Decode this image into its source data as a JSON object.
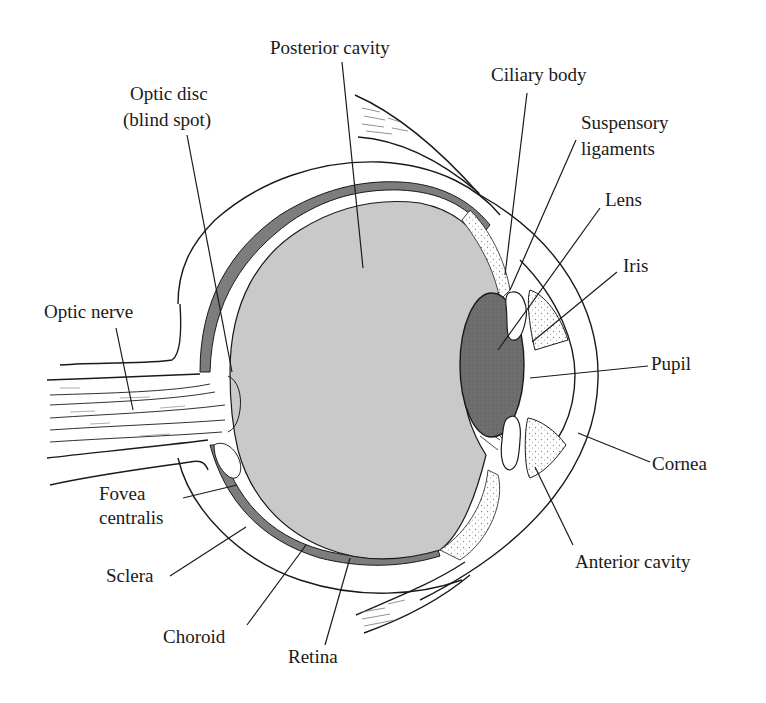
{
  "diagram": {
    "colors": {
      "background": "#ffffff",
      "ink": "#1a1a1a",
      "vitreous_fill": "#c9c9c9",
      "choroid_fill": "#7d7d7d",
      "lens_fill": "#6e6e6e",
      "stipple": "#8a8a8a"
    },
    "labels": {
      "posterior_cavity": "Posterior cavity",
      "ciliary_body": "Ciliary body",
      "optic_disc_line1": "Optic disc",
      "optic_disc_line2": "(blind spot)",
      "suspensory_line1": "Suspensory",
      "suspensory_line2": "ligaments",
      "lens": "Lens",
      "iris": "Iris",
      "optic_nerve": "Optic nerve",
      "pupil": "Pupil",
      "cornea": "Cornea",
      "fovea_line1": "Fovea",
      "fovea_line2": "centralis",
      "sclera": "Sclera",
      "anterior_cavity": "Anterior cavity",
      "choroid": "Choroid",
      "retina": "Retina"
    }
  }
}
